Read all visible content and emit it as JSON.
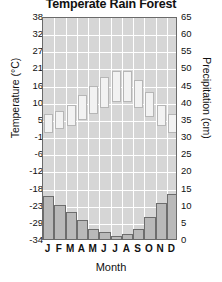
{
  "chart_data": {
    "type": "bar",
    "title": "Temperate Rain Forest",
    "xlabel": "Month",
    "categories": [
      "J",
      "F",
      "M",
      "A",
      "M",
      "J",
      "J",
      "A",
      "S",
      "O",
      "N",
      "D"
    ],
    "month_names": [
      "January",
      "February",
      "March",
      "April",
      "May",
      "June",
      "July",
      "August",
      "September",
      "October",
      "November",
      "December"
    ],
    "grid": true,
    "legend_position": "none",
    "axes": {
      "left": {
        "label": "Temperature (°C)",
        "unit": "°C",
        "ticks": [
          38,
          32,
          27,
          21,
          16,
          10,
          5,
          -1,
          -6,
          -12,
          -18,
          -23,
          -29,
          -34
        ],
        "ylim": [
          -34,
          38
        ]
      },
      "right": {
        "label": "Precipitation (cm)",
        "unit": "cm",
        "ticks": [
          65,
          60,
          55,
          50,
          45,
          40,
          35,
          30,
          25,
          20,
          15,
          10,
          5,
          0
        ],
        "ylim": [
          0,
          65
        ]
      }
    },
    "series": [
      {
        "name": "Temperature range",
        "type": "range-bar",
        "axis": "left",
        "unit": "°C",
        "low": [
          1,
          2,
          3,
          5,
          7,
          9,
          11,
          11,
          9,
          6,
          3,
          1
        ],
        "high": [
          7,
          8,
          10,
          13,
          16,
          19,
          21,
          21,
          18,
          14,
          10,
          7
        ]
      },
      {
        "name": "Precipitation",
        "type": "bar",
        "axis": "right",
        "unit": "cm",
        "values": [
          12.5,
          10,
          8,
          5.5,
          3,
          2,
          1,
          1.5,
          3,
          6.5,
          10.5,
          13
        ]
      }
    ],
    "colors": {
      "plot_background": "#d6d6d6",
      "gridline": "#ffffff",
      "temperature_bar_fill": "#f2f2f2",
      "temperature_bar_border": "#b6b6b6",
      "precipitation_bar_fill": "#b9b9b9",
      "precipitation_bar_border": "#6d6d6d",
      "axis_border": "#6a6a6a",
      "text": "#111111"
    }
  }
}
